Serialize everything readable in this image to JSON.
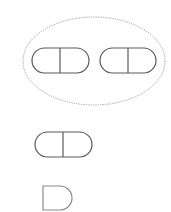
{
  "diagram": {
    "background": "#ffffff",
    "group_ellipse": {
      "cx": 94,
      "cy": 61,
      "rx": 71,
      "ry": 44,
      "stroke": "#9a9a9a",
      "style": "dotted"
    },
    "pill_stroke": "#5a5a5a",
    "d_stroke": "#8a8a8a",
    "shapes": [
      {
        "type": "pill",
        "x": 32,
        "y": 48,
        "w": 57,
        "h": 25,
        "divider_x": 60,
        "in_group": true
      },
      {
        "type": "pill",
        "x": 100,
        "y": 48,
        "w": 56,
        "h": 25,
        "divider_x": 128,
        "in_group": true
      },
      {
        "type": "pill",
        "x": 35,
        "y": 132,
        "w": 57,
        "h": 25,
        "divider_x": 63,
        "in_group": false
      },
      {
        "type": "half-pill",
        "x": 43,
        "y": 186,
        "w": 29,
        "h": 24,
        "in_group": false
      }
    ]
  }
}
